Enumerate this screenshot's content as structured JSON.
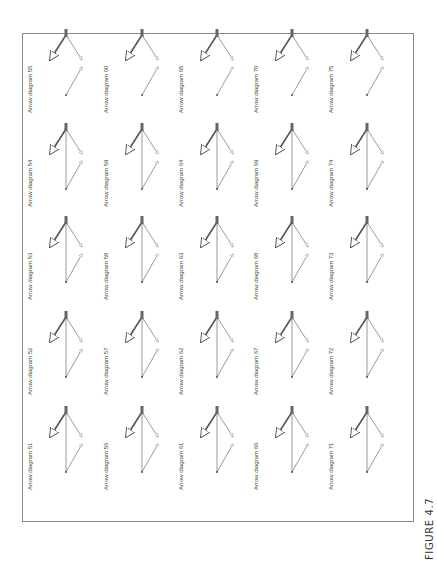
{
  "figure": {
    "caption": "FIGURE 4.7",
    "orientation": "rotated 90deg counter-clockwise",
    "diagram_label_prefix": "Arrow diagram",
    "grid": {
      "rows": 5,
      "cols": 5
    },
    "diagrams": [
      {
        "id": 51,
        "label": "Arrow diagram 51"
      },
      {
        "id": 52,
        "label": "Arrow diagram 52"
      },
      {
        "id": 53,
        "label": "Arrow diagram 53"
      },
      {
        "id": 54,
        "label": "Arrow diagram 54"
      },
      {
        "id": 55,
        "label": "Arrow diagram 55"
      },
      {
        "id": 56,
        "label": "Arrow diagram 56"
      },
      {
        "id": 57,
        "label": "Arrow diagram 57"
      },
      {
        "id": 58,
        "label": "Arrow diagram 58"
      },
      {
        "id": 59,
        "label": "Arrow diagram 59"
      },
      {
        "id": 60,
        "label": "Arrow diagram 60"
      },
      {
        "id": 61,
        "label": "Arrow diagram 61"
      },
      {
        "id": 62,
        "label": "Arrow diagram 62"
      },
      {
        "id": 63,
        "label": "Arrow diagram 63"
      },
      {
        "id": 64,
        "label": "Arrow diagram 64"
      },
      {
        "id": 65,
        "label": "Arrow diagram 65"
      },
      {
        "id": 66,
        "label": "Arrow diagram 66"
      },
      {
        "id": 67,
        "label": "Arrow diagram 67"
      },
      {
        "id": 68,
        "label": "Arrow diagram 68"
      },
      {
        "id": 69,
        "label": "Arrow diagram 69"
      },
      {
        "id": 70,
        "label": "Arrow diagram 70"
      },
      {
        "id": 71,
        "label": "Arrow diagram 71"
      },
      {
        "id": 72,
        "label": "Arrow diagram 72"
      },
      {
        "id": 73,
        "label": "Arrow diagram 73"
      },
      {
        "id": 74,
        "label": "Arrow diagram 74"
      },
      {
        "id": 75,
        "label": "Arrow diagram 75"
      }
    ]
  }
}
